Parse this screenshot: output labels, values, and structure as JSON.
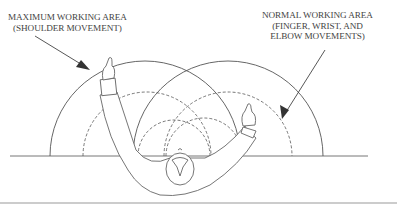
{
  "figure": {
    "labels": {
      "maximum": {
        "line1": "MAXIMUM WORKING AREA",
        "line2": "(SHOULDER MOVEMENT)"
      },
      "normal": {
        "line1": "NORMAL WORKING AREA",
        "line2": "(FINGER, WRIST, AND",
        "line3": "ELBOW MOVEMENTS)"
      }
    },
    "elements": {
      "max_area_arcs": "solid",
      "normal_area_arcs": "dashed",
      "figure": "top-down view of seated worker at table"
    },
    "colors": {
      "line": "#555555",
      "background": "#ffffff"
    }
  }
}
